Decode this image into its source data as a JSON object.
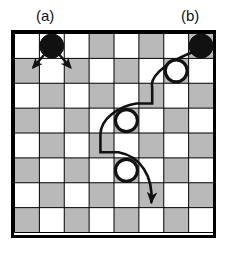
{
  "figure": {
    "type": "checkers-board-diagram",
    "panels": [
      {
        "id": "a",
        "label": "(a)",
        "caption_position": "top-left"
      },
      {
        "id": "b",
        "label": "(b)",
        "caption_position": "top-right"
      }
    ]
  },
  "board": {
    "rows": 8,
    "cols": 8,
    "square_size": 25.6,
    "light_color": "#ffffff",
    "dark_color": "#b9b9b9",
    "border_color": "#000000",
    "grid_line_color": "#000000",
    "border_width": 3,
    "grid_width": 1,
    "pattern_note": "dark squares where (row+col) is odd",
    "dark_squares": [
      [
        0,
        3
      ],
      [
        0,
        5
      ],
      [
        0,
        7
      ],
      [
        1,
        0
      ],
      [
        1,
        2
      ],
      [
        1,
        4
      ],
      [
        1,
        6
      ],
      [
        2,
        1
      ],
      [
        2,
        3
      ],
      [
        2,
        5
      ],
      [
        2,
        7
      ],
      [
        3,
        0
      ],
      [
        3,
        2
      ],
      [
        3,
        4
      ],
      [
        3,
        6
      ],
      [
        4,
        1
      ],
      [
        4,
        3
      ],
      [
        4,
        5
      ],
      [
        4,
        7
      ],
      [
        5,
        0
      ],
      [
        5,
        2
      ],
      [
        5,
        4
      ],
      [
        5,
        6
      ],
      [
        6,
        1
      ],
      [
        6,
        3
      ],
      [
        6,
        5
      ],
      [
        6,
        7
      ],
      [
        7,
        0
      ],
      [
        7,
        2
      ],
      [
        7,
        4
      ],
      [
        7,
        6
      ]
    ]
  },
  "pieces": [
    {
      "name": "black-piece-a",
      "color": "#111111",
      "style": "filled",
      "row": 0,
      "col": 1,
      "radius": 12
    },
    {
      "name": "black-piece-b",
      "color": "#111111",
      "style": "filled",
      "row": 0,
      "col": 7,
      "radius": 12
    },
    {
      "name": "white-piece-1",
      "color": "#ffffff",
      "style": "outline",
      "row": 1,
      "col": 6,
      "radius": 11
    },
    {
      "name": "white-piece-2",
      "color": "#ffffff",
      "style": "outline",
      "row": 3,
      "col": 4,
      "radius": 11
    },
    {
      "name": "white-piece-3",
      "color": "#ffffff",
      "style": "outline",
      "row": 5,
      "col": 4,
      "radius": 11
    }
  ],
  "moves": {
    "simple_moves": {
      "from_piece": "black-piece-a",
      "arrows": [
        {
          "name": "simple-move-arrow-left",
          "from_row": 0,
          "from_col": 1,
          "to_row": 1,
          "to_col": 0
        },
        {
          "name": "simple-move-arrow-right",
          "from_row": 0,
          "from_col": 1,
          "to_row": 1,
          "to_col": 2
        }
      ]
    },
    "jump_sequence": {
      "from_piece": "black-piece-b",
      "name": "multi-jump-path",
      "captures": [
        "white-piece-1",
        "white-piece-2",
        "white-piece-3"
      ],
      "end_row": 6,
      "end_col": 5
    }
  },
  "colors": {
    "ink": "#111111",
    "dark_square": "#b9b9b9",
    "light_square": "#ffffff"
  }
}
